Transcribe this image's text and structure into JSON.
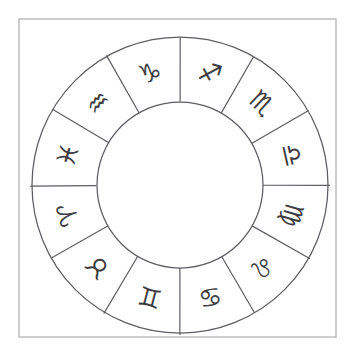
{
  "image": {
    "title": "Zodiac Wheel Diagram",
    "description": "Hand-drawn circular zodiac wheel divided into twelve sectors, each containing an astrological sign glyph",
    "background_color": "#ffffff",
    "frame_color": "#b9b9bc",
    "ink_color": "#5d5d63",
    "glyph_color": "#3c3c41"
  },
  "wheel": {
    "center_x": 180,
    "center_y": 185,
    "outer_radius": 148,
    "inner_radius": 83,
    "glyph_radius": 116,
    "segment_count": 12,
    "segment_span_degrees": 30,
    "start_offset_degrees": -90
  },
  "frame": {
    "x": 19,
    "y": 19,
    "width": 317,
    "height": 318
  },
  "segments": [
    {
      "index": 0,
      "name": "sagittarius",
      "label": "Sagittarius",
      "glyph": "♐",
      "glyph_name": "sagittarius-arrow-glyph",
      "position": "top-right",
      "angle_center_degrees": -75,
      "rotation_degrees": 15
    },
    {
      "index": 1,
      "name": "scorpio",
      "label": "Scorpio",
      "glyph": "♏",
      "glyph_name": "scorpio-glyph",
      "position": "upper-right",
      "angle_center_degrees": -45,
      "rotation_degrees": 45
    },
    {
      "index": 2,
      "name": "libra",
      "label": "Libra",
      "glyph": "♎",
      "glyph_name": "libra-scales-glyph",
      "position": "right",
      "angle_center_degrees": -15,
      "rotation_degrees": 75
    },
    {
      "index": 3,
      "name": "virgo",
      "label": "Virgo",
      "glyph": "♍",
      "glyph_name": "virgo-glyph",
      "position": "lower-right",
      "angle_center_degrees": 15,
      "rotation_degrees": 105
    },
    {
      "index": 4,
      "name": "leo",
      "label": "Leo",
      "glyph": "♌",
      "glyph_name": "leo-glyph",
      "position": "bottom-right",
      "angle_center_degrees": 45,
      "rotation_degrees": 135
    },
    {
      "index": 5,
      "name": "cancer",
      "label": "Cancer",
      "glyph": "♋",
      "glyph_name": "cancer-glyph",
      "position": "bottom-right-inner",
      "angle_center_degrees": 75,
      "rotation_degrees": 165
    },
    {
      "index": 6,
      "name": "gemini",
      "label": "Gemini",
      "glyph": "♊",
      "glyph_name": "gemini-glyph",
      "position": "bottom-left-inner",
      "angle_center_degrees": 105,
      "rotation_degrees": 195
    },
    {
      "index": 7,
      "name": "taurus",
      "label": "Taurus",
      "glyph": "♉",
      "glyph_name": "taurus-glyph",
      "position": "bottom-left",
      "angle_center_degrees": 135,
      "rotation_degrees": 225
    },
    {
      "index": 8,
      "name": "aries",
      "label": "Aries",
      "glyph": "♈",
      "glyph_name": "aries-glyph",
      "position": "left",
      "angle_center_degrees": 165,
      "rotation_degrees": 255
    },
    {
      "index": 9,
      "name": "pisces",
      "label": "Pisces",
      "glyph": "♓",
      "glyph_name": "pisces-glyph",
      "position": "upper-left",
      "angle_center_degrees": 195,
      "rotation_degrees": 285
    },
    {
      "index": 10,
      "name": "aquarius",
      "label": "Aquarius",
      "glyph": "♒",
      "glyph_name": "aquarius-waves-glyph",
      "position": "top-left",
      "angle_center_degrees": 225,
      "rotation_degrees": 315
    },
    {
      "index": 11,
      "name": "capricorn",
      "label": "Capricorn",
      "glyph": "♑",
      "glyph_name": "capricorn-glyph",
      "position": "top",
      "angle_center_degrees": 255,
      "rotation_degrees": 345
    }
  ]
}
